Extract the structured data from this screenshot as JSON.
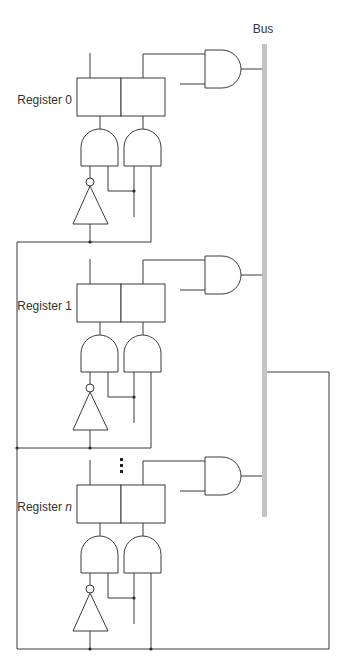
{
  "diagram": {
    "bus": {
      "label": "Bus",
      "color": "#c4c4c4",
      "x": 262,
      "width": 5,
      "top": 44,
      "bottom": 517,
      "label_x": 263,
      "label_y": 33
    },
    "wire_color": "#3a3a3a",
    "registers": [
      {
        "label": "Register ",
        "suffix": "0",
        "suffix_italic": false,
        "offset": 0
      },
      {
        "label": "Register ",
        "suffix": "1",
        "suffix_italic": false,
        "offset": 206
      },
      {
        "label": "Register ",
        "suffix": "n",
        "suffix_italic": true,
        "offset": 407
      }
    ],
    "ellipsis": {
      "x": 120,
      "ys": [
        458,
        464,
        470
      ],
      "size": 3
    },
    "loop_right": {
      "x": 329,
      "bus_y": 372,
      "bottom_y": 649
    },
    "loop_left": {
      "x": 17
    }
  }
}
